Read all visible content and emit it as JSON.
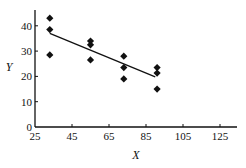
{
  "chart_data": {
    "type": "scatter",
    "title": "",
    "xlabel": "X",
    "ylabel": "Y",
    "xlim": [
      25,
      133
    ],
    "ylim": [
      0,
      45
    ],
    "xticks": [
      25,
      45,
      65,
      85,
      105,
      125
    ],
    "yticks": [
      0,
      10,
      20,
      30,
      40
    ],
    "grid": false,
    "legend": null,
    "series": [
      {
        "name": "observations",
        "marker": "diamond",
        "color": "#111111",
        "points": [
          {
            "x": 33,
            "y": 43
          },
          {
            "x": 33,
            "y": 38.5
          },
          {
            "x": 33,
            "y": 28.5
          },
          {
            "x": 55,
            "y": 34
          },
          {
            "x": 55,
            "y": 32.5
          },
          {
            "x": 55,
            "y": 26.5
          },
          {
            "x": 73,
            "y": 28
          },
          {
            "x": 73,
            "y": 23.5
          },
          {
            "x": 73,
            "y": 19
          },
          {
            "x": 91,
            "y": 23.5
          },
          {
            "x": 91,
            "y": 21.3
          },
          {
            "x": 91,
            "y": 15
          }
        ]
      }
    ],
    "fit_line": {
      "name": "regression line",
      "color": "#111111",
      "from": {
        "x": 33,
        "y": 37
      },
      "to": {
        "x": 90,
        "y": 19.8
      }
    }
  },
  "layout": {
    "plot_left": 35,
    "plot_right": 237,
    "plot_top": 10,
    "plot_bottom": 127,
    "x_px_per_unit": 1.85,
    "y_px_per_unit": 2.53
  }
}
